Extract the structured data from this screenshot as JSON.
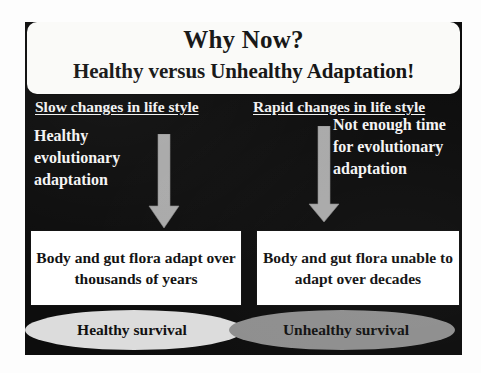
{
  "slide": {
    "title": "Why Now?",
    "subtitle": "Healthy versus Unhealthy Adaptation!",
    "background_color": "#0d0d0d",
    "header_background_color": "#fafaf8",
    "columns": [
      {
        "id": "slow",
        "heading": "Slow changes in life style",
        "body": "Healthy evolutionary adaptation",
        "arrow": {
          "name": "down-arrow-icon",
          "direction": "down",
          "color": "#a8a8a8"
        },
        "outcome": "Body and gut flora adapt over thousands of years",
        "survival": {
          "label": "Healthy survival",
          "fill_color": "#dcdcdc"
        }
      },
      {
        "id": "rapid",
        "heading": "Rapid changes in life style",
        "body": "Not enough time for evolutionary adaptation",
        "arrow": {
          "name": "down-arrow-icon",
          "direction": "down",
          "color": "#a8a8a8"
        },
        "outcome": "Body and gut flora unable to adapt over decades",
        "survival": {
          "label": "Unhealthy survival",
          "fill_color": "#8e8e8e"
        }
      }
    ]
  }
}
